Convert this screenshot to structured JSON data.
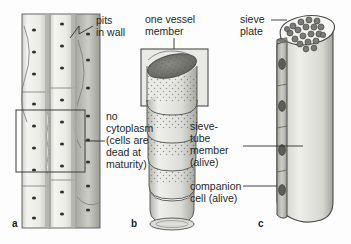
{
  "figure": {
    "background_color": "#fdfdfd",
    "text_color": "#25282b"
  },
  "panels": [
    {
      "letter": "a",
      "name": "xylem-vessel-panel",
      "subject": "xylem vessel elements with pitted walls",
      "labels": [
        {
          "id": "pits",
          "lines": [
            "pits",
            "in wall"
          ]
        },
        {
          "id": "no-cytoplasm",
          "lines": [
            "no",
            "cytoplasm",
            "(cells are",
            "dead at",
            "maturity)"
          ]
        }
      ]
    },
    {
      "letter": "b",
      "name": "vessel-member-panel",
      "subject": "stacked vessel members forming a vessel",
      "labels": [
        {
          "id": "one-vessel-member",
          "lines": [
            "one vessel",
            "member"
          ]
        }
      ]
    },
    {
      "letter": "c",
      "name": "phloem-sieve-tube-panel",
      "subject": "sieve-tube member with companion cell",
      "labels": [
        {
          "id": "sieve-plate",
          "lines": [
            "sieve",
            "plate"
          ]
        },
        {
          "id": "sieve-tube-member",
          "lines": [
            "sieve-",
            "tube",
            "member",
            "(alive)"
          ]
        },
        {
          "id": "companion-cell",
          "lines": [
            "companion",
            "cell (alive)"
          ]
        }
      ]
    }
  ],
  "text": {
    "pits_l1": "pits",
    "pits_l2": "in wall",
    "nocyto_l1": "no",
    "nocyto_l2": "cytoplasm",
    "nocyto_l3": "(cells are",
    "nocyto_l4": "dead at",
    "nocyto_l5": "maturity)",
    "vessel_l1": "one vessel",
    "vessel_l2": "member",
    "sieveplate_l1": "sieve",
    "sieveplate_l2": "plate",
    "sievetube_l1": "sieve-",
    "sievetube_l2": "tube",
    "sievetube_l3": "member",
    "sievetube_l4": "(alive)",
    "companion_l1": "companion",
    "companion_l2": "cell (alive)",
    "letter_a": "a",
    "letter_b": "b",
    "letter_c": "c"
  },
  "colors": {
    "outline": "#4a4a4a",
    "wall_light": "#f2f2f0",
    "wall_mid": "#d8d8d4",
    "wall_dark": "#b9b9b4",
    "lumen_dark": "#6e6e6e",
    "pit_dark": "#3a3a3a",
    "phloem_fill": "#cfcfca",
    "nucleus": "#5a5a5a",
    "leader": "#2e2e2e"
  }
}
